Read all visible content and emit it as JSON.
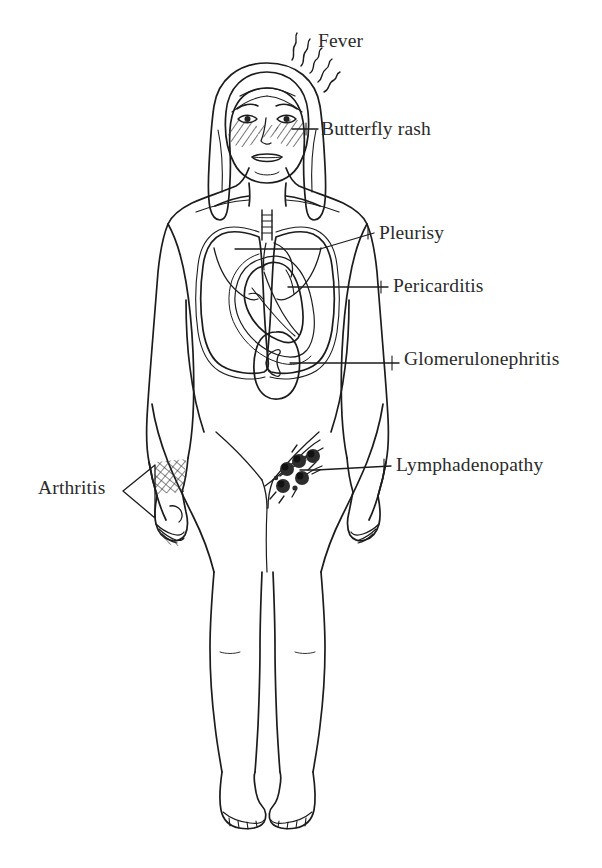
{
  "figure": {
    "background_color": "#ffffff",
    "ink_color": "#2b2b2b",
    "line_color": "#1c1c1c"
  },
  "labels": {
    "fever": "Fever",
    "butterfly_rash": "Butterfly rash",
    "pleurisy": "Pleurisy",
    "pericarditis": "Pericarditis",
    "glomerulonephritis": "Glomerulonephritis",
    "lymphadenopathy": "Lymphadenopathy",
    "arthritis": "Arthritis"
  },
  "annotations": [
    {
      "id": "fever",
      "label": "Fever",
      "side": "right",
      "target": "head-heat-waves",
      "icon": "heat-wave-icon"
    },
    {
      "id": "butterfly-rash",
      "label": "Butterfly rash",
      "side": "right",
      "target": "face-malar-region",
      "icon": "hatched-rash-icon"
    },
    {
      "id": "pleurisy",
      "label": "Pleurisy",
      "side": "right",
      "target": "pleura-lungs",
      "icon": "lungs-icon"
    },
    {
      "id": "pericarditis",
      "label": "Pericarditis",
      "side": "right",
      "target": "pericardium-heart",
      "icon": "heart-icon"
    },
    {
      "id": "glomerulonephritis",
      "label": "Glomerulonephritis",
      "side": "right",
      "target": "kidney",
      "icon": "kidney-icon"
    },
    {
      "id": "lymphadenopathy",
      "label": "Lymphadenopathy",
      "side": "right",
      "target": "inguinal-lymph-nodes",
      "icon": "lymph-node-cluster-icon"
    },
    {
      "id": "arthritis",
      "label": "Arthritis",
      "side": "left",
      "target": "wrist-hand-joints",
      "icon": "hatched-joint-icon"
    }
  ]
}
